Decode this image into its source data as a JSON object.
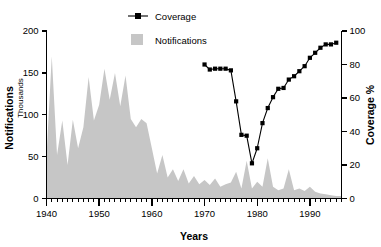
{
  "chart_data": {
    "type": "area",
    "title": "",
    "xlabel": "Years",
    "ylabel": "Notifications",
    "ylabel_sub": "Thousands",
    "y2label": "Coverage %",
    "xlim": [
      1940,
      1996
    ],
    "ylim": [
      0,
      200
    ],
    "y2lim": [
      0,
      100
    ],
    "xticks": [
      1940,
      1950,
      1960,
      1970,
      1980,
      1990
    ],
    "xticklabels": [
      "1940",
      "1950",
      "1960",
      "1970",
      "1980",
      "1990"
    ],
    "xminor_step": 1,
    "yticks": [
      0,
      50,
      100,
      150,
      200
    ],
    "yticklabels": [
      "0",
      "50",
      "100",
      "150",
      "200"
    ],
    "y2ticks": [
      0,
      20,
      40,
      60,
      80,
      100
    ],
    "y2ticklabels": [
      "0",
      "20",
      "40",
      "60",
      "80",
      "100"
    ],
    "grid": false,
    "legend_position": "top-center",
    "colors": {
      "notifications_fill": "#c6c6c6",
      "coverage_line": "#000000",
      "axis": "#000000",
      "background": "#ffffff"
    },
    "series": [
      {
        "name": "Notifications",
        "kind": "area",
        "axis": "left",
        "units": "thousands",
        "x": [
          1940,
          1941,
          1942,
          1943,
          1944,
          1945,
          1946,
          1947,
          1948,
          1949,
          1950,
          1951,
          1952,
          1953,
          1954,
          1955,
          1956,
          1957,
          1958,
          1959,
          1960,
          1961,
          1962,
          1963,
          1964,
          1965,
          1966,
          1967,
          1968,
          1969,
          1970,
          1971,
          1972,
          1973,
          1974,
          1975,
          1976,
          1977,
          1978,
          1979,
          1980,
          1981,
          1982,
          1983,
          1984,
          1985,
          1986,
          1987,
          1988,
          1989,
          1990,
          1991,
          1992,
          1993,
          1994,
          1995,
          1996
        ],
        "values": [
          50,
          170,
          52,
          93,
          40,
          94,
          60,
          85,
          145,
          93,
          112,
          155,
          118,
          150,
          110,
          147,
          95,
          85,
          95,
          90,
          60,
          30,
          52,
          25,
          35,
          21,
          35,
          18,
          27,
          17,
          22,
          16,
          24,
          14,
          17,
          19,
          32,
          12,
          45,
          12,
          20,
          14,
          48,
          14,
          10,
          12,
          35,
          10,
          12,
          9,
          14,
          8,
          6,
          5,
          4,
          3,
          3
        ]
      },
      {
        "name": "Coverage",
        "kind": "line",
        "axis": "right",
        "units": "percent",
        "x": [
          1970,
          1971,
          1972,
          1973,
          1974,
          1975,
          1976,
          1977,
          1978,
          1979,
          1980,
          1981,
          1982,
          1983,
          1984,
          1985,
          1986,
          1987,
          1988,
          1989,
          1990,
          1991,
          1992,
          1993,
          1994,
          1995
        ],
        "values": [
          80,
          77,
          77.5,
          77.5,
          77.5,
          76.5,
          58,
          38,
          37.5,
          21,
          30,
          45,
          54,
          60.5,
          65.5,
          66,
          71,
          73,
          76,
          79,
          84,
          87,
          90,
          92,
          92,
          93
        ]
      }
    ]
  },
  "legend": {
    "items": [
      {
        "label": "Coverage",
        "marker": "line-square-marker",
        "color": "#000000"
      },
      {
        "label": "Notifications",
        "marker": "filled-square",
        "color": "#c6c6c6"
      }
    ]
  }
}
